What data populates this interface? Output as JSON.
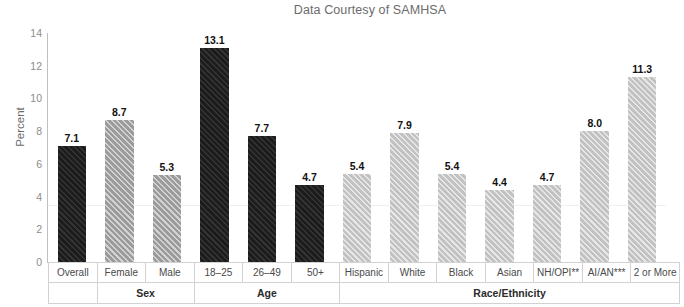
{
  "chart_data": {
    "type": "bar",
    "title": "Data Courtesy of SAMHSA",
    "xlabel": "",
    "ylabel": "Percent",
    "ylim": [
      0,
      14
    ],
    "yticks": [
      "0",
      "2",
      "4",
      "6",
      "8",
      "10",
      "12",
      "14"
    ],
    "grid": false,
    "legend": "none",
    "categories": [
      "Overall",
      "Female",
      "Male",
      "18–25",
      "26–49",
      "50+",
      "Hispanic",
      "White",
      "Black",
      "Asian",
      "NH/OPI**",
      "AI/AN***",
      "2 or More"
    ],
    "values": [
      7.1,
      8.7,
      5.3,
      13.1,
      7.7,
      4.7,
      5.4,
      7.9,
      5.4,
      4.4,
      4.7,
      8.0,
      11.3
    ],
    "value_labels": [
      "7.1",
      "8.7",
      "5.3",
      "13.1",
      "7.7",
      "4.7",
      "5.4",
      "7.9",
      "5.4",
      "4.4",
      "4.7",
      "8.0",
      "11.3"
    ],
    "bar_styles": [
      "dark",
      "mid",
      "mid",
      "dark",
      "dark",
      "dark",
      "light",
      "light",
      "light",
      "light",
      "light",
      "light",
      "light"
    ],
    "groups": [
      {
        "label": "",
        "span": 1
      },
      {
        "label": "Sex",
        "span": 2
      },
      {
        "label": "Age",
        "span": 3
      },
      {
        "label": "Race/Ethnicity",
        "span": 7
      }
    ],
    "colors": {
      "dark": "#1c1c1c",
      "mid": "#9b9b9b",
      "light": "#c2c2c2",
      "title": "#6b6b6b",
      "tick": "#8c8c8c",
      "axis": "#bfbfbf",
      "table_border": "#d2d2d2",
      "value_label": "#111111"
    }
  }
}
